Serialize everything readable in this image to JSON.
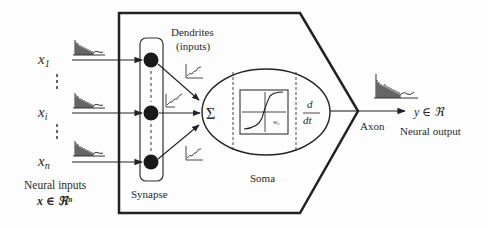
{
  "diagram": {
    "type": "biological neuron model",
    "inputs": {
      "labels": [
        {
          "base": "x",
          "sub": "1"
        },
        {
          "base": "x",
          "sub": "i"
        },
        {
          "base": "x",
          "sub": "n"
        }
      ],
      "caption_line1": "Neural inputs",
      "caption_line2": "x ∈ ℜⁿ"
    },
    "labels": {
      "dendrites_line1": "Dendrites",
      "dendrites_line2": "(inputs)",
      "synapse": "Synapse",
      "soma": "Soma",
      "sigma": "Σ",
      "w0": "w₀",
      "derivative_num": "d",
      "derivative_den": "dt",
      "axon": "Axon",
      "output": "y ∈ ℜ",
      "output_caption": "Neural output"
    },
    "colors": {
      "stroke": "#222222",
      "background": "#fdfdfd"
    }
  }
}
